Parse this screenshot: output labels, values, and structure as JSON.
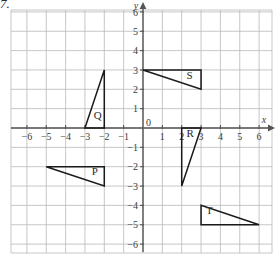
{
  "question_number": "7.",
  "chart_data": {
    "type": "scatter",
    "title": "",
    "xlabel": "x",
    "ylabel": "y",
    "xlim": [
      -7,
      7
    ],
    "ylim": [
      -6.8,
      6.8
    ],
    "grid": true,
    "grid_color": "#b9b9b9",
    "axis_color": "#555555",
    "shape_color": "#1a1a1a",
    "origin_label": "0",
    "x_ticks": [
      -6,
      -5,
      -4,
      -3,
      -2,
      -1,
      1,
      2,
      3,
      4,
      5,
      6
    ],
    "x_tick_labels": [
      "−6",
      "−5",
      "−4",
      "−3",
      "−2",
      "−1",
      "1",
      "2",
      "3",
      "4",
      "5",
      "6"
    ],
    "y_ticks": [
      6,
      5,
      4,
      3,
      2,
      1,
      -1,
      -2,
      -3,
      -4,
      -5,
      -6
    ],
    "y_tick_labels": [
      "6",
      "5",
      "4",
      "3",
      "2",
      "1",
      "−1",
      "−2",
      "−3",
      "−4",
      "−5",
      "−6"
    ],
    "shapes": [
      {
        "label": "P",
        "type": "triangle",
        "vertices": [
          [
            -5,
            -2
          ],
          [
            -2,
            -2
          ],
          [
            -2,
            -3
          ]
        ],
        "label_pos": [
          -2.65,
          -2.42
        ]
      },
      {
        "label": "Q",
        "type": "triangle",
        "vertices": [
          [
            -3,
            0
          ],
          [
            -2,
            0
          ],
          [
            -2,
            3
          ]
        ],
        "label_pos": [
          -2.55,
          0.45
        ]
      },
      {
        "label": "R",
        "type": "triangle",
        "vertices": [
          [
            2,
            0
          ],
          [
            3,
            0
          ],
          [
            2,
            -3
          ]
        ],
        "label_pos": [
          2.25,
          -0.47
        ]
      },
      {
        "label": "S",
        "type": "triangle",
        "vertices": [
          [
            0,
            3
          ],
          [
            3,
            3
          ],
          [
            3,
            2
          ]
        ],
        "label_pos": [
          2.25,
          2.55
        ]
      },
      {
        "label": "T",
        "type": "triangle",
        "vertices": [
          [
            3,
            -4
          ],
          [
            3,
            -5
          ],
          [
            6,
            -5
          ]
        ],
        "label_pos": [
          3.25,
          -4.45
        ]
      }
    ]
  }
}
